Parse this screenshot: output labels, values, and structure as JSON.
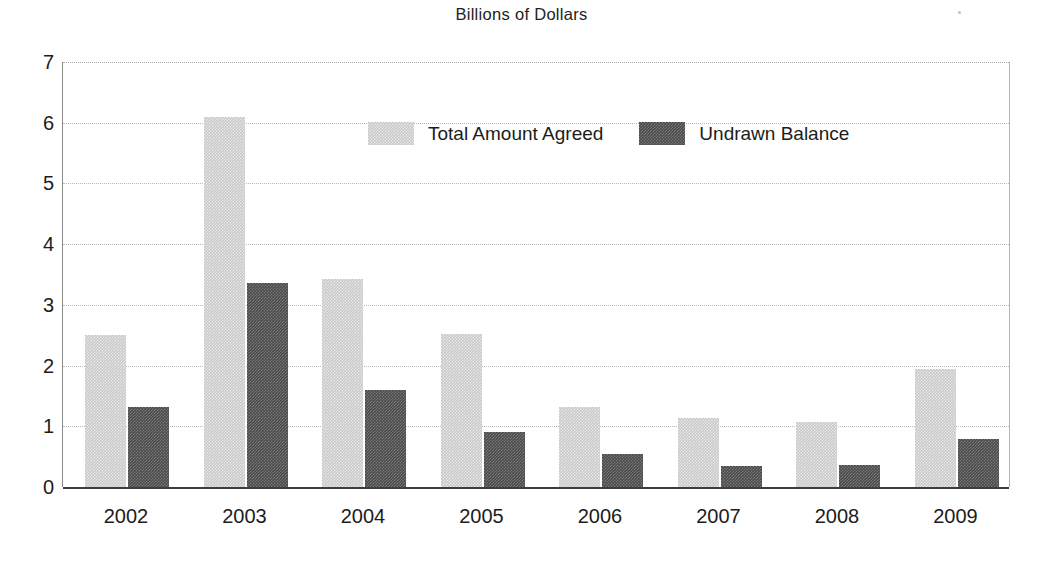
{
  "chart_data": {
    "type": "bar",
    "title": "Billions of Dollars",
    "xlabel": "",
    "ylabel": "",
    "ylim": [
      0,
      7
    ],
    "yticks": [
      0,
      1,
      2,
      3,
      4,
      5,
      6,
      7
    ],
    "grid": true,
    "legend_position": "inside-top-center",
    "categories": [
      "2002",
      "2003",
      "2004",
      "2005",
      "2006",
      "2007",
      "2008",
      "2009"
    ],
    "series": [
      {
        "name": "Total Amount Agreed",
        "color": "#c9c9c9",
        "values": [
          2.5,
          6.1,
          3.42,
          2.52,
          1.32,
          1.13,
          1.07,
          1.95
        ]
      },
      {
        "name": "Undrawn Balance",
        "color": "#4b4b4b",
        "values": [
          1.32,
          3.36,
          1.6,
          0.9,
          0.55,
          0.35,
          0.37,
          0.79
        ]
      }
    ]
  },
  "legend": {
    "entries": [
      {
        "label": "Total Amount Agreed",
        "swatch": "light"
      },
      {
        "label": "Undrawn Balance",
        "swatch": "dark"
      }
    ]
  }
}
